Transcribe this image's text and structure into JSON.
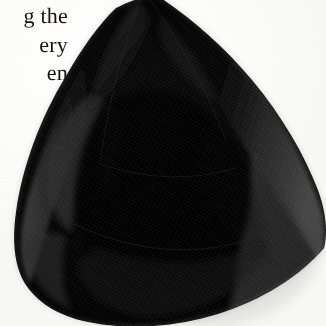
{
  "page": {
    "kind": "scanned-book-plate",
    "background_color": "#fdfdfd",
    "width": 326,
    "height": 326
  },
  "text_column": {
    "alignment": "right",
    "ink_color": "#15120f",
    "clipped_at_left_edge": true,
    "lines": [
      {
        "text": "g the"
      },
      {
        "text": "ery"
      },
      {
        "text": "en"
      },
      {
        "text": ","
      }
    ]
  },
  "photograph": {
    "subject": "trillion-cut black gemstone",
    "cut": "trillion",
    "body_color": "#000000",
    "facet_colors": {
      "darkest": "#000000",
      "deep": "#090909",
      "mid": "#1b1b1b",
      "light": "#2d2d2d",
      "highlight": "#3c3c3c",
      "rim": "#474747"
    },
    "shadow_color": "#d8d8d8",
    "cropped_top": true,
    "apex_position": "top-center",
    "facets": [
      {
        "name": "table",
        "tone": "darkest"
      },
      {
        "name": "crown-left",
        "tone": "mid"
      },
      {
        "name": "crown-right",
        "tone": "deep"
      },
      {
        "name": "upper-girdle-left",
        "tone": "light"
      },
      {
        "name": "upper-girdle-right",
        "tone": "light"
      },
      {
        "name": "pavilion-lower",
        "tone": "darkest"
      },
      {
        "name": "bezel-right",
        "tone": "highlight"
      },
      {
        "name": "bezel-left",
        "tone": "mid"
      }
    ]
  }
}
